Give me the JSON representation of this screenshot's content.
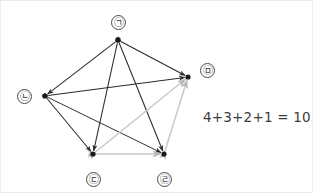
{
  "diagram": {
    "type": "complete-graph",
    "background_color": "#ffffff",
    "border_color": "#ececec",
    "edge_color_dark": "#2b2b2b",
    "edge_color_light": "#c9c9c9",
    "node_dot_color": "#1a1a1a",
    "label_text_color": "#3a3a3a",
    "nodes": [
      {
        "id": "n1",
        "label": "㉠",
        "x": 117,
        "y": 39,
        "label_x": 110,
        "label_y": 14
      },
      {
        "id": "n2",
        "label": "㉡",
        "x": 44,
        "y": 95,
        "label_x": 16,
        "label_y": 88
      },
      {
        "id": "n3",
        "label": "㉢",
        "x": 92,
        "y": 153,
        "label_x": 85,
        "label_y": 171
      },
      {
        "id": "n4",
        "label": "㉣",
        "x": 163,
        "y": 153,
        "label_x": 156,
        "label_y": 171
      },
      {
        "id": "n5",
        "label": "㉤",
        "x": 187,
        "y": 76,
        "label_x": 199,
        "label_y": 62
      }
    ],
    "edges": [
      {
        "from": "n1",
        "to": "n2",
        "shade": "dark"
      },
      {
        "from": "n1",
        "to": "n3",
        "shade": "dark"
      },
      {
        "from": "n1",
        "to": "n4",
        "shade": "dark"
      },
      {
        "from": "n1",
        "to": "n5",
        "shade": "dark"
      },
      {
        "from": "n2",
        "to": "n3",
        "shade": "dark"
      },
      {
        "from": "n2",
        "to": "n4",
        "shade": "dark"
      },
      {
        "from": "n2",
        "to": "n5",
        "shade": "dark"
      },
      {
        "from": "n3",
        "to": "n4",
        "shade": "light"
      },
      {
        "from": "n3",
        "to": "n5",
        "shade": "light"
      },
      {
        "from": "n4",
        "to": "n5",
        "shade": "light"
      }
    ]
  },
  "annotation": {
    "equation": "4+3+2+1 = 10개"
  }
}
